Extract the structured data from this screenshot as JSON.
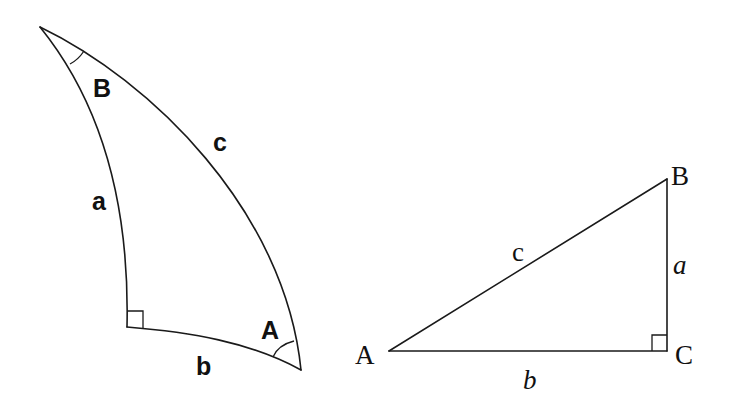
{
  "spherical_triangle": {
    "vertices": {
      "B": {
        "label": "B"
      },
      "A": {
        "label": "A"
      },
      "C": {
        "label": "",
        "right_angle": true
      }
    },
    "sides": {
      "a": {
        "label": "a"
      },
      "b": {
        "label": "b"
      },
      "c": {
        "label": "c"
      }
    }
  },
  "planar_triangle": {
    "vertices": {
      "A": {
        "label": "A"
      },
      "B": {
        "label": "B"
      },
      "C": {
        "label": "C",
        "right_angle": true
      }
    },
    "sides": {
      "a": {
        "label": "a"
      },
      "b": {
        "label": "b"
      },
      "c": {
        "label": "c"
      }
    }
  },
  "colors": {
    "stroke": "#1a1a1a",
    "text": "#111111",
    "background": "#ffffff"
  }
}
